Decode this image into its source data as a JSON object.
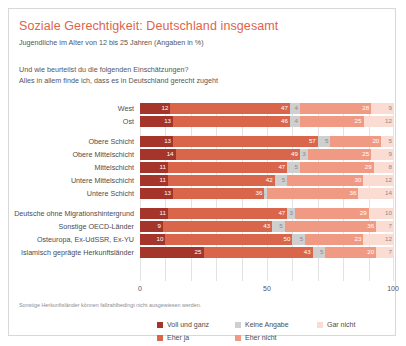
{
  "header": {
    "title": "Soziale Gerechtigkeit: Deutschland insgesamt",
    "subtitle": "Jugendliche im Alter von 12 bis 25 Jahren (Angaben in %)",
    "question_line1": "Und wie beurteilst du die folgenden Einschätzungen?",
    "question_line2": "Alles in allem finde ich, dass es in Deutschland gerecht zugeht"
  },
  "footnote": "Sonstige Herkunftsländer können fallzahlbedingt nicht ausgewiesen werden.",
  "colors": {
    "title": "#e0634a",
    "voll_und_ganz": "#a5352a",
    "eher_ja": "#d9654b",
    "keine_angabe": "#cfcfcf",
    "eher_nicht": "#f09a83",
    "gar_nicht": "#fbdcd2",
    "card_border": "#d8d8d8",
    "grid": "#e3e3e3"
  },
  "chart_data": {
    "type": "bar",
    "orientation": "horizontal",
    "stacked": true,
    "normalized_percent": true,
    "title": "Soziale Gerechtigkeit: Deutschland insgesamt",
    "subtitle": "Jugendliche im Alter von 12 bis 25 Jahren (Angaben in %)",
    "question": "Und wie beurteilst du die folgenden Einschätzungen? Alles in allem finde ich, dass es in Deutschland gerecht zugeht",
    "xlabel": "",
    "ylabel": "",
    "xlim": [
      0,
      100
    ],
    "xticks": [
      "0",
      "50",
      "100"
    ],
    "grid": true,
    "legend_position": "bottom",
    "series": [
      {
        "name": "Voll und ganz",
        "color": "#a5352a",
        "values": [
          12,
          13,
          13,
          14,
          11,
          11,
          13,
          11,
          9,
          10,
          25
        ]
      },
      {
        "name": "Eher ja",
        "color": "#d9654b",
        "values": [
          47,
          46,
          57,
          49,
          47,
          42,
          36,
          47,
          43,
          50,
          43
        ]
      },
      {
        "name": "Keine Angabe",
        "color": "#cfcfcf",
        "values": [
          4,
          4,
          5,
          3,
          5,
          5,
          1,
          3,
          5,
          5,
          5
        ]
      },
      {
        "name": "Eher nicht",
        "color": "#f09a83",
        "values": [
          28,
          25,
          20,
          25,
          29,
          30,
          36,
          29,
          36,
          23,
          20
        ]
      },
      {
        "name": "Gar nicht",
        "color": "#fbdcd2",
        "values": [
          9,
          12,
          5,
          9,
          8,
          12,
          14,
          10,
          7,
          12,
          7
        ]
      }
    ],
    "groups": [
      {
        "categories": [
          "West",
          "Ost"
        ],
        "rows": [
          {
            "label": "West",
            "values": [
              12,
              47,
              4,
              28,
              9
            ]
          },
          {
            "label": "Ost",
            "values": [
              13,
              46,
              4,
              25,
              12
            ]
          }
        ]
      },
      {
        "categories": [
          "Obere Schicht",
          "Obere Mittelschicht",
          "Mittelschicht",
          "Untere Mittelschicht",
          "Untere Schicht"
        ],
        "rows": [
          {
            "label": "Obere Schicht",
            "values": [
              13,
              57,
              5,
              20,
              5
            ]
          },
          {
            "label": "Obere Mittelschicht",
            "values": [
              14,
              49,
              3,
              25,
              9
            ]
          },
          {
            "label": "Mittelschicht",
            "values": [
              11,
              47,
              5,
              29,
              8
            ]
          },
          {
            "label": "Untere Mittelschicht",
            "values": [
              11,
              42,
              5,
              30,
              12
            ]
          },
          {
            "label": "Untere Schicht",
            "values": [
              13,
              36,
              1,
              36,
              14
            ]
          }
        ]
      },
      {
        "categories": [
          "Deutsche ohne Migrationshintergrund",
          "Sonstige OECD-Länder",
          "Osteuropa, Ex-UdSSR, Ex-YU",
          "Islamisch geprägte Herkunftsländer"
        ],
        "rows": [
          {
            "label": "Deutsche ohne Migrationshintergrund",
            "values": [
              11,
              47,
              3,
              29,
              10
            ]
          },
          {
            "label": "Sonstige OECD-Länder",
            "values": [
              9,
              43,
              5,
              36,
              7
            ]
          },
          {
            "label": "Osteuropa, Ex-UdSSR, Ex-YU",
            "values": [
              10,
              50,
              5,
              23,
              12
            ]
          },
          {
            "label": "Islamisch geprägte Herkunftsländer",
            "values": [
              25,
              43,
              5,
              20,
              7
            ]
          }
        ]
      }
    ],
    "legend": [
      {
        "label": "Voll und ganz",
        "color": "#a5352a"
      },
      {
        "label": "Keine Angabe",
        "color": "#cfcfcf"
      },
      {
        "label": "Gar nicht",
        "color": "#fbdcd2"
      },
      {
        "label": "Eher ja",
        "color": "#d9654b"
      },
      {
        "label": "Eher nicht",
        "color": "#f09a83"
      }
    ]
  }
}
